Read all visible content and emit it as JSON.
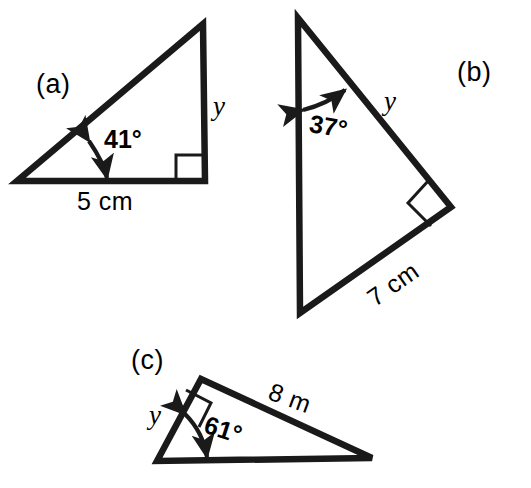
{
  "figure": {
    "background_color": "#ffffff",
    "stroke_color": "#1a1a1a",
    "parts": [
      {
        "id": "a",
        "part_label": "(a)",
        "angle_label": "41°",
        "angle_value": 41,
        "unknown_label": "y",
        "side_label": "5 cm",
        "side_value": 5,
        "side_unit": "cm",
        "right_angle_marker": "square"
      },
      {
        "id": "b",
        "part_label": "(b)",
        "angle_label": "37°",
        "angle_value": 37,
        "unknown_label": "y",
        "side_label": "7 cm",
        "side_value": 7,
        "side_unit": "cm",
        "right_angle_marker": "square"
      },
      {
        "id": "c",
        "part_label": "(c)",
        "angle_label": "61°",
        "angle_value": 61,
        "unknown_label": "y",
        "side_label": "8 m",
        "side_value": 8,
        "side_unit": "m",
        "right_angle_marker": "square"
      }
    ]
  }
}
